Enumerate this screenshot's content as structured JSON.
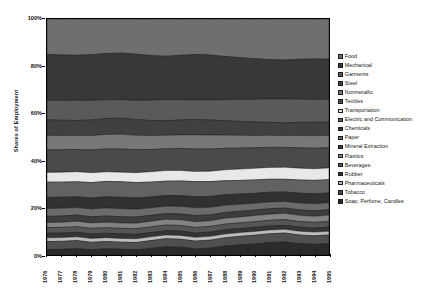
{
  "chart_data": {
    "type": "area",
    "stacked": true,
    "normalized": true,
    "title": "",
    "xlabel": "",
    "ylabel": "Shares of Employment",
    "ylim": [
      0,
      100
    ],
    "ytick_labels": [
      "0%",
      "20%",
      "40%",
      "60%",
      "80%",
      "100%"
    ],
    "ytick_values": [
      0,
      20,
      40,
      60,
      80,
      100
    ],
    "grid": false,
    "legend_position": "right",
    "x": [
      1976,
      1977,
      1978,
      1979,
      1980,
      1981,
      1982,
      1983,
      1984,
      1985,
      1986,
      1987,
      1988,
      1989,
      1990,
      1991,
      1992,
      1993,
      1994,
      1995
    ],
    "xtick_labels": [
      "1976",
      "1977",
      "1978",
      "1979",
      "1980",
      "1981",
      "1982",
      "1983",
      "1984",
      "1985",
      "1986",
      "1987",
      "1988",
      "1989",
      "1990",
      "1991",
      "1992",
      "1993",
      "1994",
      "1995"
    ],
    "series": [
      {
        "name": "Food",
        "color": "#6f6f6f",
        "values": [
          15.0,
          15.2,
          15.4,
          15.1,
          14.8,
          14.6,
          14.9,
          15.5,
          15.8,
          15.4,
          15.0,
          15.3,
          15.9,
          16.4,
          16.8,
          17.2,
          17.4,
          17.1,
          16.9,
          17.0
        ]
      },
      {
        "name": "Mechanical",
        "color": "#383838",
        "values": [
          19.5,
          19.3,
          19.0,
          19.4,
          19.8,
          20.0,
          19.6,
          18.9,
          18.4,
          18.8,
          19.3,
          19.0,
          18.3,
          17.7,
          17.2,
          16.7,
          16.5,
          16.9,
          17.2,
          17.0
        ]
      },
      {
        "name": "Garments",
        "color": "#5a5a5a",
        "values": [
          8.2,
          8.4,
          8.6,
          8.3,
          8.0,
          7.9,
          8.1,
          8.6,
          8.9,
          8.6,
          8.3,
          8.5,
          8.9,
          9.3,
          9.6,
          9.9,
          10.1,
          9.8,
          9.6,
          9.7
        ]
      },
      {
        "name": "Steel",
        "color": "#404040",
        "values": [
          6.6,
          6.5,
          6.4,
          6.6,
          6.8,
          6.9,
          6.7,
          6.4,
          6.2,
          6.3,
          6.5,
          6.4,
          6.1,
          5.9,
          5.7,
          5.5,
          5.4,
          5.6,
          5.7,
          5.6
        ]
      },
      {
        "name": "Nonmetallic",
        "color": "#787878",
        "values": [
          6.1,
          6.0,
          5.9,
          6.1,
          6.2,
          6.3,
          6.1,
          5.9,
          5.7,
          5.8,
          6.0,
          5.9,
          5.6,
          5.4,
          5.2,
          5.1,
          5.0,
          5.2,
          5.3,
          5.2
        ]
      },
      {
        "name": "Textiles",
        "color": "#4a4a4a",
        "values": [
          9.6,
          9.5,
          9.4,
          9.6,
          9.8,
          9.9,
          9.7,
          9.4,
          9.2,
          9.3,
          9.5,
          9.4,
          9.1,
          8.9,
          8.7,
          8.5,
          8.4,
          8.6,
          8.7,
          8.6
        ]
      },
      {
        "name": "Transportation",
        "color": "#e8e8e8",
        "values": [
          4.1,
          4.2,
          4.3,
          4.2,
          4.1,
          4.1,
          4.2,
          4.4,
          4.5,
          4.4,
          4.3,
          4.4,
          4.6,
          4.8,
          4.9,
          5.0,
          5.1,
          5.0,
          4.9,
          5.0
        ]
      },
      {
        "name": "Electric and Communication",
        "color": "#626262",
        "values": [
          6.5,
          6.4,
          6.3,
          6.5,
          6.6,
          6.7,
          6.5,
          6.3,
          6.1,
          6.2,
          6.4,
          6.3,
          6.0,
          5.8,
          5.7,
          5.5,
          5.4,
          5.6,
          5.7,
          5.6
        ]
      },
      {
        "name": "Chemicals",
        "color": "#313131",
        "values": [
          4.7,
          4.7,
          4.6,
          4.7,
          4.8,
          4.9,
          4.8,
          4.6,
          4.5,
          4.6,
          4.7,
          4.6,
          4.4,
          4.3,
          4.2,
          4.1,
          4.0,
          4.2,
          4.2,
          4.2
        ]
      },
      {
        "name": "Paper",
        "color": "#6b6b6b",
        "values": [
          3.3,
          3.3,
          3.2,
          3.3,
          3.4,
          3.4,
          3.3,
          3.2,
          3.1,
          3.2,
          3.3,
          3.2,
          3.1,
          3.0,
          2.9,
          2.9,
          2.8,
          2.9,
          3.0,
          2.9
        ]
      },
      {
        "name": "Mineral Extraction",
        "color": "#3d3d3d",
        "values": [
          2.6,
          2.6,
          2.6,
          2.6,
          2.7,
          2.7,
          2.6,
          2.5,
          2.5,
          2.5,
          2.6,
          2.5,
          2.4,
          2.4,
          2.3,
          2.3,
          2.2,
          2.3,
          2.3,
          2.3
        ]
      },
      {
        "name": "Plastics",
        "color": "#838383",
        "values": [
          2.2,
          2.2,
          2.3,
          2.3,
          2.3,
          2.3,
          2.3,
          2.4,
          2.4,
          2.4,
          2.4,
          2.4,
          2.5,
          2.5,
          2.6,
          2.6,
          2.7,
          2.6,
          2.6,
          2.7
        ]
      },
      {
        "name": "Beverages",
        "color": "#555555",
        "values": [
          2.4,
          2.4,
          2.4,
          2.4,
          2.4,
          2.4,
          2.4,
          2.4,
          2.4,
          2.4,
          2.4,
          2.4,
          2.4,
          2.4,
          2.4,
          2.4,
          2.4,
          2.4,
          2.4,
          2.4
        ]
      },
      {
        "name": "Rubber",
        "color": "#353535",
        "values": [
          1.9,
          1.9,
          1.9,
          1.9,
          1.9,
          1.9,
          1.9,
          1.8,
          1.8,
          1.8,
          1.8,
          1.8,
          1.8,
          1.7,
          1.7,
          1.7,
          1.7,
          1.7,
          1.7,
          1.7
        ]
      },
      {
        "name": "Pharmaceuticals",
        "color": "#bcbcbc",
        "values": [
          1.6,
          1.6,
          1.6,
          1.6,
          1.6,
          1.6,
          1.6,
          1.6,
          1.6,
          1.6,
          1.6,
          1.6,
          1.6,
          1.6,
          1.6,
          1.6,
          1.6,
          1.6,
          1.6,
          1.6
        ]
      },
      {
        "name": "Tobacco",
        "color": "#4f4f4f",
        "values": [
          3.4,
          3.4,
          3.4,
          3.2,
          3.1,
          3.0,
          3.1,
          3.3,
          3.4,
          3.4,
          3.3,
          3.4,
          3.5,
          3.6,
          3.7,
          3.7,
          3.8,
          3.7,
          3.6,
          3.7
        ]
      },
      {
        "name": "Soap, Perfume, Candles",
        "color": "#2b2b2b",
        "values": [
          2.3,
          2.4,
          2.7,
          2.2,
          2.7,
          2.5,
          2.2,
          2.8,
          3.5,
          3.3,
          2.6,
          2.9,
          3.8,
          4.3,
          4.7,
          5.3,
          5.5,
          4.8,
          4.5,
          4.8
        ]
      }
    ]
  },
  "legend": {
    "items": [
      {
        "label": "Food"
      },
      {
        "label": "Mechanical"
      },
      {
        "label": "Garments"
      },
      {
        "label": "Steel"
      },
      {
        "label": "Nonmetallic"
      },
      {
        "label": "Textiles"
      },
      {
        "label": "Transportation"
      },
      {
        "label": "Electric and Communication"
      },
      {
        "label": "Chemicals"
      },
      {
        "label": "Paper"
      },
      {
        "label": "Mineral Extraction"
      },
      {
        "label": "Plastics"
      },
      {
        "label": "Beverages"
      },
      {
        "label": "Rubber"
      },
      {
        "label": "Pharmaceuticals"
      },
      {
        "label": "Tobacco"
      },
      {
        "label": "Soap, Perfume, Candles"
      }
    ]
  }
}
